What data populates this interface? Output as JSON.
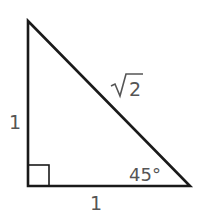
{
  "diagram": {
    "type": "right-triangle",
    "colors": {
      "stroke": "#1a1a1a",
      "label": "#555555",
      "background": "#ffffff"
    },
    "labels": {
      "left_leg": "1",
      "bottom_leg": "1",
      "hypotenuse_radicand": "2",
      "angle": "45°"
    },
    "right_angle_marker": true
  }
}
